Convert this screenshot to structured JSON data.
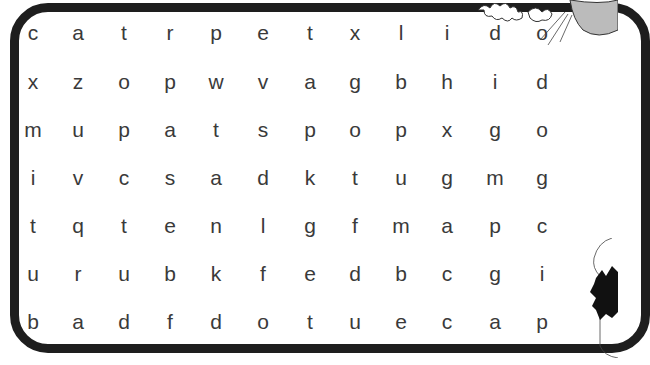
{
  "puzzle": {
    "title": "",
    "rows": [
      [
        "c",
        "a",
        "t",
        "r",
        "p",
        "e",
        "t",
        "x",
        "l",
        "i",
        "d",
        "o"
      ],
      [
        "x",
        "z",
        "o",
        "p",
        "w",
        "v",
        "a",
        "g",
        "b",
        "h",
        "i",
        "d"
      ],
      [
        "m",
        "u",
        "p",
        "a",
        "t",
        "s",
        "p",
        "o",
        "p",
        "x",
        "g",
        "o"
      ],
      [
        "i",
        "v",
        "c",
        "s",
        "a",
        "d",
        "k",
        "t",
        "u",
        "g",
        "m",
        "g"
      ],
      [
        "t",
        "q",
        "t",
        "e",
        "n",
        "l",
        "g",
        "f",
        "m",
        "a",
        "p",
        "c"
      ],
      [
        "u",
        "r",
        "u",
        "b",
        "k",
        "f",
        "e",
        "d",
        "b",
        "c",
        "g",
        "i"
      ],
      [
        "b",
        "a",
        "d",
        "f",
        "d",
        "o",
        "t",
        "u",
        "e",
        "c",
        "a",
        "p"
      ]
    ]
  },
  "decorations": {
    "top_right": "cat-illustration",
    "bottom_right": "character-illustration"
  },
  "colors": {
    "frame": "#1e1e1e",
    "letters": "#3a3a3a",
    "background": "#ffffff"
  }
}
